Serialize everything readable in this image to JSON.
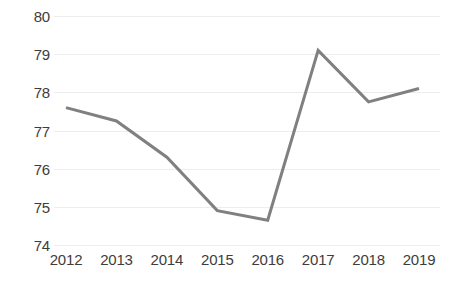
{
  "chart_data": {
    "type": "line",
    "title": "",
    "subtitle": "",
    "xlabel": "",
    "ylabel": "",
    "categories": [
      "2012",
      "2013",
      "2014",
      "2015",
      "2016",
      "2017",
      "2018",
      "2019"
    ],
    "series": [
      {
        "name": "Series 1",
        "color": "#808080",
        "values": [
          77.6,
          77.25,
          76.3,
          74.9,
          74.65,
          79.1,
          77.75,
          78.1
        ]
      }
    ],
    "ylim": [
      74,
      80
    ],
    "ytick_labels": [
      "80",
      "79",
      "78",
      "77",
      "76",
      "75",
      "74"
    ],
    "ytick_values": [
      80,
      79,
      78,
      77,
      76,
      75,
      74
    ],
    "xtick_labels": [
      "2012",
      "2013",
      "2014",
      "2015",
      "2016",
      "2017",
      "2018",
      "2019"
    ],
    "grid": true,
    "grid_color": "#ededed",
    "legend": false,
    "legend_position": "none",
    "markers": false,
    "line_width": 3,
    "background_color": "#ffffff",
    "tick_label_color": "#3d3d3d"
  },
  "axes": {
    "y_axis_name": "y-axis",
    "x_axis_name": "x-axis"
  }
}
